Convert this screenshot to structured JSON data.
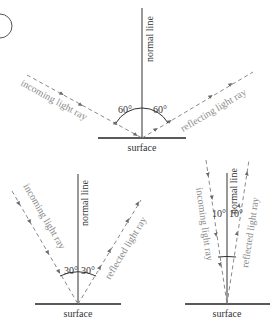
{
  "diagrams": [
    {
      "id": "top",
      "normal_label": "normal line",
      "surface_label": "surface",
      "incoming_label": "incoming light ray",
      "reflected_label": "reflecting light ray",
      "angle_in": "60°",
      "angle_out": "60°"
    },
    {
      "id": "bottom-left",
      "normal_label": "normal line",
      "surface_label": "surface",
      "incoming_label": "incoming light ray",
      "reflected_label": "reflected light ray",
      "angle_in": "30°",
      "angle_out": "30°"
    },
    {
      "id": "bottom-right",
      "normal_label": "normal line",
      "surface_label": "surface",
      "incoming_label": "incoming light ray",
      "reflected_label": "reflected light ray",
      "angle_in": "10°",
      "angle_out": "10°"
    }
  ],
  "colors": {
    "line": "#333333",
    "ray": "#8a8a8a"
  }
}
